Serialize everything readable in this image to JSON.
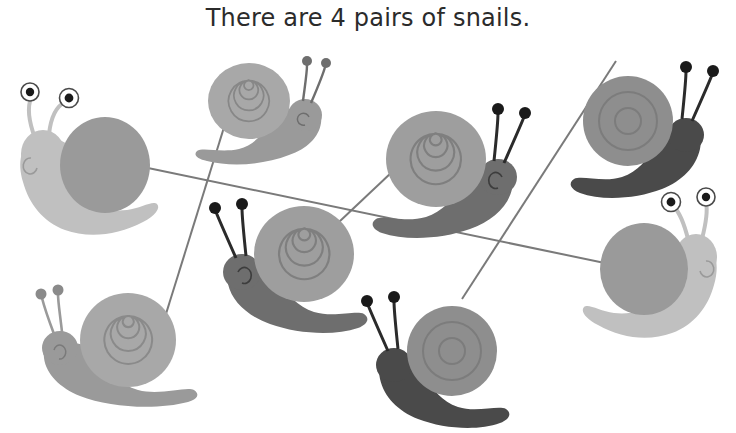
{
  "page": {
    "title": "There are 4 pairs of snails.",
    "background_color": "#ffffff",
    "width": 736,
    "height": 433
  },
  "worksheet": {
    "instruction_text": "There are 4 pairs of snails.",
    "pair_count": 4,
    "snail_count": 8,
    "line_color": "#7a7a7a"
  },
  "colors": {
    "light_gray": "#b9b9b9",
    "pale_gray": "#c6c6c6",
    "mid_gray": "#9a9a9a",
    "shell_gray": "#a3a3a3",
    "dark_gray": "#6e6e6e",
    "darkest": "#4a4a4a",
    "near_black": "#3d3d3d",
    "eye_white": "#ffffff",
    "pupil": "#1a1a1a",
    "outline": "#8a8a8a",
    "title_color": "#2b2b2b"
  },
  "snails": [
    {
      "id": "snail-top-left",
      "label": "light snail with large white eyes, facing left",
      "facing": "left",
      "body_color": "#c0c0c0",
      "shell_color": "#9a9a9a",
      "shell_style": "plain",
      "eye_style": "large-white",
      "x": 95,
      "y": 160
    },
    {
      "id": "snail-top-middle",
      "label": "gray spiral-shell snail, facing right",
      "facing": "right",
      "body_color": "#9a9a9a",
      "shell_color": "#a8a8a8",
      "shell_style": "spiral",
      "eye_style": "small-dot",
      "x": 255,
      "y": 115
    },
    {
      "id": "snail-mid-right",
      "label": "spiral-shell snail with dark body, facing right",
      "facing": "right",
      "body_color": "#6e6e6e",
      "shell_color": "#9e9e9e",
      "shell_style": "spiral",
      "eye_style": "small-dot",
      "x": 440,
      "y": 175
    },
    {
      "id": "snail-top-right",
      "label": "dark snail with plain shell, facing right",
      "facing": "right",
      "body_color": "#4a4a4a",
      "shell_color": "#8e8e8e",
      "shell_style": "plain",
      "eye_style": "small-dot",
      "x": 640,
      "y": 135
    },
    {
      "id": "snail-mid-left",
      "label": "spiral-shell snail with dark body, facing left",
      "facing": "left",
      "body_color": "#6e6e6e",
      "shell_color": "#9e9e9e",
      "shell_style": "spiral",
      "eye_style": "small-dot",
      "x": 300,
      "y": 270
    },
    {
      "id": "snail-right-middle",
      "label": "light snail with large white eyes, facing right",
      "facing": "right",
      "body_color": "#c0c0c0",
      "shell_color": "#9a9a9a",
      "shell_style": "plain",
      "eye_style": "large-white",
      "x": 660,
      "y": 265
    },
    {
      "id": "snail-bottom-left",
      "label": "gray spiral-shell snail, facing left",
      "facing": "left",
      "body_color": "#9a9a9a",
      "shell_color": "#a8a8a8",
      "shell_style": "spiral",
      "eye_style": "small-dot",
      "x": 110,
      "y": 350
    },
    {
      "id": "snail-bottom-middle",
      "label": "dark snail with plain shell, facing left",
      "facing": "left",
      "body_color": "#4a4a4a",
      "shell_color": "#8e8e8e",
      "shell_style": "plain",
      "eye_style": "small-dot",
      "x": 440,
      "y": 365
    }
  ],
  "connection_lines": [
    {
      "id": "line-light-pair",
      "from": "snail-top-left",
      "to": "snail-right-middle",
      "x1": 100,
      "y1": 158,
      "x2": 648,
      "y2": 272
    },
    {
      "id": "line-spiral-pair",
      "from": "snail-top-middle",
      "to": "snail-bottom-left",
      "x1": 235,
      "y1": 92,
      "x2": 156,
      "y2": 346
    },
    {
      "id": "line-darkbody-spiral-pair",
      "from": "snail-mid-right",
      "to": "snail-mid-left",
      "x1": 392,
      "y1": 172,
      "x2": 322,
      "y2": 238
    },
    {
      "id": "line-dark-pair",
      "from": "snail-top-right",
      "to": "snail-bottom-middle",
      "x1": 616,
      "y1": 61,
      "x2": 462,
      "y2": 299
    }
  ]
}
